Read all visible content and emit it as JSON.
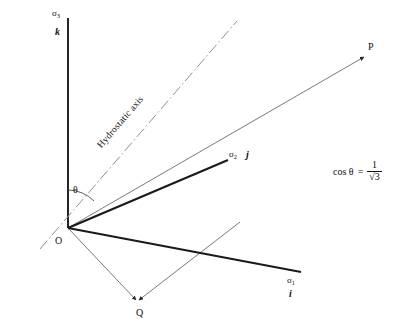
{
  "figure": {
    "axes": [
      {
        "id": "sigma3",
        "sigma_label": "σ",
        "sigma_sub": "3",
        "basis_label": "k",
        "direction": "vertical-up"
      },
      {
        "id": "sigma2",
        "sigma_label": "σ",
        "sigma_sub": "2",
        "basis_label": "j",
        "direction": "upper-right"
      },
      {
        "id": "sigma1",
        "sigma_label": "σ",
        "sigma_sub": "1",
        "basis_label": "i",
        "direction": "lower-right"
      }
    ],
    "origin_label": "O",
    "points": [
      {
        "id": "P",
        "label": "P"
      },
      {
        "id": "Q",
        "label": "Q"
      }
    ],
    "angle_label": "θ",
    "hydrostatic_axis_label": "Hydrostatic axis",
    "hydrostatic_axis_rotation_deg": -37,
    "equation": {
      "lhs": "cos θ",
      "equals": "=",
      "numerator": "1",
      "denominator": "√3"
    },
    "colors": {
      "stroke_heavy": "#1a1a1a",
      "stroke_light": "#6b6b6b",
      "dashdot": "#8a8a8a",
      "text": "#111111",
      "background": "#ffffff"
    }
  }
}
